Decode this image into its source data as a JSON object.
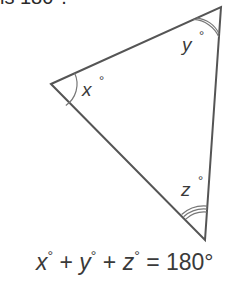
{
  "header": {
    "text": "is 180°."
  },
  "triangle": {
    "vertices": {
      "left": [
        51,
        84
      ],
      "top": [
        221,
        7
      ],
      "bottom": [
        205,
        240
      ]
    },
    "stroke_color": "#555555",
    "angles": [
      {
        "name": "x",
        "label": "x",
        "degree_symbol": "°",
        "arcs": 1
      },
      {
        "name": "y",
        "label": "y",
        "degree_symbol": "°",
        "arcs": 2
      },
      {
        "name": "z",
        "label": "z",
        "degree_symbol": "°",
        "arcs": 3
      }
    ]
  },
  "equation": {
    "x": "x",
    "y": "y",
    "z": "z",
    "deg": "°",
    "plus": "+",
    "equals": "=",
    "result": "180°"
  }
}
